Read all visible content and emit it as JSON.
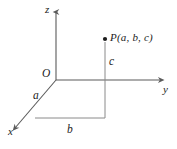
{
  "figure": {
    "type": "3d-coordinate-axes-diagram",
    "background_color": "#ffffff",
    "line_color": "#5a5a5a",
    "text_color": "#1c1c1c",
    "axes": {
      "z": {
        "label": "z",
        "direction": "up"
      },
      "y": {
        "label": "y",
        "direction": "right"
      },
      "x": {
        "label": "x",
        "direction": "down-left"
      }
    },
    "origin": {
      "label": "O"
    },
    "point": {
      "label": "P(a, b, c)",
      "dot": true
    },
    "segments": [
      {
        "name": "a",
        "label": "a"
      },
      {
        "name": "b",
        "label": "b"
      },
      {
        "name": "c",
        "label": "c"
      }
    ]
  }
}
